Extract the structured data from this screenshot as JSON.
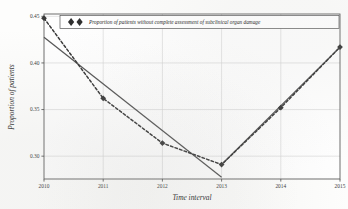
{
  "chart_data": {
    "type": "line",
    "title": "",
    "subtitle": "",
    "xlabel": "Time interval",
    "ylabel": "Proportion of patients",
    "x": [
      2010,
      2011,
      2012,
      2013,
      2014,
      2015
    ],
    "xtick_labels": [
      "2010",
      "2011",
      "2012",
      "2013",
      "2014",
      "2015"
    ],
    "ytick_labels": [
      "0.45",
      "0.40",
      "0.35",
      "0.30"
    ],
    "ytick_values": [
      0.45,
      0.4,
      0.35,
      0.3
    ],
    "xlim": [
      2010,
      2015
    ],
    "ylim": [
      0.2755,
      0.4525
    ],
    "grid": true,
    "legend_position": "top-center",
    "series": [
      {
        "name": "Proportion of patients without complete assessment of subclinical organ damage",
        "style": "dashed-with-diamond-markers",
        "color": "#3a3a3a",
        "values": [
          0.448,
          0.362,
          0.314,
          0.291,
          0.352,
          0.417
        ]
      },
      {
        "name": "trend",
        "style": "solid-line",
        "color": "#555555",
        "segments": [
          {
            "x": [
              2010,
              2013
            ],
            "y": [
              0.4275,
              0.2775
            ]
          },
          {
            "x": [
              2013,
              2015
            ],
            "y": [
              0.291,
              0.417
            ]
          }
        ]
      }
    ]
  },
  "legend": {
    "entries": [
      {
        "label": "Proportion of patients without complete assessment of subclinical organ damage",
        "marker": "diamond-pair-marker"
      }
    ]
  },
  "axes": {
    "x_title": "Time interval",
    "y_title": "Proportion of patients"
  },
  "colors": {
    "plot_background": "#fdfdfc",
    "axis": "#4a4a4a",
    "grid": "#cfcfcf",
    "data": "#3a3a3a",
    "trend": "#555555"
  }
}
